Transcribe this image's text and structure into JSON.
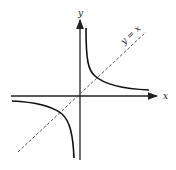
{
  "diagram": {
    "axes": {
      "x_label": "x",
      "y_label": "y"
    },
    "line_label": "y = x",
    "curve": "hyperbola y = 1/x",
    "colors": {
      "axis": "#222222",
      "curve": "#111111",
      "dashed": "#555555"
    }
  }
}
